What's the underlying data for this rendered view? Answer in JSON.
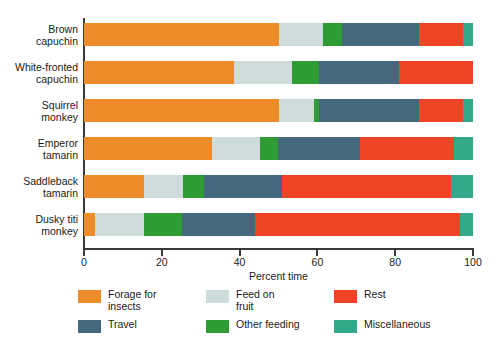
{
  "chart_data": {
    "type": "bar",
    "orientation": "horizontal",
    "stacked": true,
    "normalized": true,
    "title": "",
    "xlabel": "Percent time",
    "ylabel": "",
    "xlim": [
      0,
      100
    ],
    "xticks": [
      0,
      20,
      40,
      60,
      80,
      100
    ],
    "xtick_labels": [
      "0",
      "20",
      "40",
      "60",
      "80",
      "100"
    ],
    "grid": false,
    "legend_position": "bottom",
    "categories": [
      "Brown capuchin",
      "White-fronted capuchin",
      "Squirrel monkey",
      "Emperor tamarin",
      "Saddleback tamarin",
      "Dusky titi monkey"
    ],
    "category_lines": [
      [
        "Brown",
        "capuchin"
      ],
      [
        "White-fronted",
        "capuchin"
      ],
      [
        "Squirrel",
        "monkey"
      ],
      [
        "Emperor",
        "tamarin"
      ],
      [
        "Saddleback",
        "tamarin"
      ],
      [
        "Dusky titi",
        "monkey"
      ]
    ],
    "series": [
      {
        "name": "Forage for insects",
        "color": "#ED8B2A",
        "values": [
          50.0,
          38.6,
          50.0,
          32.8,
          15.4,
          2.8
        ]
      },
      {
        "name": "Feed on fruit",
        "color": "#CFDCDC",
        "values": [
          11.4,
          15.0,
          9.0,
          12.4,
          10.1,
          12.5
        ]
      },
      {
        "name": "Other feeding",
        "color": "#2E9B34",
        "values": [
          4.8,
          6.9,
          1.3,
          4.8,
          5.3,
          9.8
        ]
      },
      {
        "name": "Travel",
        "color": "#44687D",
        "values": [
          20.0,
          20.5,
          25.9,
          21.0,
          20.2,
          18.9
        ]
      },
      {
        "name": "Rest",
        "color": "#EF4425",
        "values": [
          11.3,
          19.0,
          11.3,
          24.2,
          43.3,
          52.7
        ]
      },
      {
        "name": "Miscellaneous",
        "color": "#33A98C",
        "values": [
          2.5,
          0.0,
          2.5,
          4.8,
          5.7,
          3.3
        ]
      }
    ],
    "legend_entries": [
      {
        "label": "Forage for\ninsects",
        "color": "#ED8B2A"
      },
      {
        "label": "Feed on\nfruit",
        "color": "#CFDCDC"
      },
      {
        "label": "Rest",
        "color": "#EF4425"
      },
      {
        "label": "Travel",
        "color": "#44687D"
      },
      {
        "label": "Other feeding",
        "color": "#2E9B34"
      },
      {
        "label": "Miscellaneous",
        "color": "#33A98C"
      }
    ],
    "legend_order_drawn": [
      "Forage for insects",
      "Feed on fruit",
      "Rest",
      "Travel",
      "Other feeding",
      "Miscellaneous"
    ],
    "axis_color": "#3a3a3a",
    "background": "#ffffff"
  }
}
